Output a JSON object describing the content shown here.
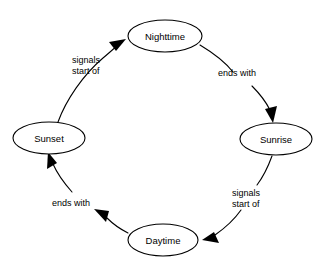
{
  "diagram": {
    "type": "cycle-diagram",
    "title": "",
    "background_color": "#ffffff",
    "stroke_color": "#000000",
    "node_fill_color": "#ffffff",
    "nodes": [
      {
        "id": "nighttime",
        "label": "Nighttime",
        "cx": 165,
        "cy": 36,
        "rx": 37,
        "ry": 16
      },
      {
        "id": "sunrise",
        "label": "Sunrise",
        "cx": 276,
        "cy": 139,
        "rx": 36,
        "ry": 16
      },
      {
        "id": "daytime",
        "label": "Daytime",
        "cx": 163,
        "cy": 240,
        "rx": 35,
        "ry": 16
      },
      {
        "id": "sunset",
        "label": "Sunset",
        "cx": 49,
        "cy": 138,
        "rx": 36,
        "ry": 16
      }
    ],
    "edges": [
      {
        "id": "nighttime-to-sunrise",
        "from": "nighttime",
        "to": "sunrise",
        "label_line1": "ends with",
        "label_line2": "",
        "label_x": 236,
        "label_y": 76
      },
      {
        "id": "sunrise-to-daytime",
        "from": "sunrise",
        "to": "daytime",
        "label_line1": "signals",
        "label_line2": "start of",
        "label_x": 232,
        "label_y": 196
      },
      {
        "id": "daytime-to-sunset",
        "from": "daytime",
        "to": "sunset",
        "label_line1": "ends with",
        "label_line2": "",
        "label_x": 76,
        "label_y": 206
      },
      {
        "id": "sunset-to-nighttime",
        "from": "sunset",
        "to": "nighttime",
        "label_line1": "signals",
        "label_line2": "start of",
        "label_x": 72,
        "label_y": 63
      }
    ]
  }
}
